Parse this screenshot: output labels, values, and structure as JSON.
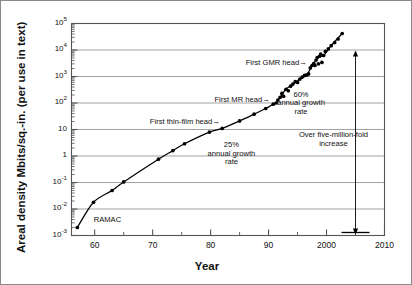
{
  "figure": {
    "name": "areal-density-vs-year",
    "axis_titles": {
      "x": "Year",
      "y": "Areal density Mbits/sq.-in. (per use in text)"
    }
  },
  "chart_data": {
    "type": "scatter",
    "title": "",
    "xlabel": "Year",
    "ylabel": "Areal density Mbits/sq.-in. (per use in text)",
    "xlim": [
      1956,
      2010
    ],
    "ylim": [
      0.001,
      100000
    ],
    "yscale": "log",
    "grid": "horizontal-major-only",
    "legend": "none",
    "x_major_ticks": [
      1960,
      1970,
      1980,
      1990,
      2000,
      2010
    ],
    "x_major_tick_labels": [
      "60",
      "70",
      "80",
      "90",
      "2000",
      "2010"
    ],
    "x_minor_ticks": [
      1965,
      1975,
      1985,
      1995,
      2005
    ],
    "y_major_ticks": [
      0.001,
      0.01,
      0.1,
      1,
      10,
      100,
      1000,
      10000,
      100000
    ],
    "y_major_tick_labels": [
      "10-3",
      "10-2",
      "10-1",
      "1",
      "10",
      "102",
      "103",
      "104",
      "105"
    ],
    "y_tick_mantissas": [
      "10",
      "10",
      "10",
      "1",
      "10",
      "10",
      "10",
      "10",
      "10"
    ],
    "y_tick_exponents": [
      "-3",
      "-2",
      "-1",
      "",
      "",
      "2",
      "3",
      "4",
      "5"
    ],
    "series": [
      {
        "name": "Areal density",
        "marker": "filled-circle",
        "line": "solid-trend",
        "points": [
          [
            1957.0,
            0.002
          ],
          [
            1959.8,
            0.018
          ],
          [
            1963.0,
            0.05
          ],
          [
            1965.0,
            0.105
          ],
          [
            1971.0,
            0.76
          ],
          [
            1973.5,
            1.6
          ],
          [
            1975.5,
            2.9
          ],
          [
            1979.8,
            8.0
          ],
          [
            1982.0,
            11.0
          ],
          [
            1985.0,
            21.0
          ],
          [
            1987.5,
            38.0
          ],
          [
            1989.5,
            62.0
          ],
          [
            1990.8,
            90.0
          ],
          [
            1991.3,
            100.0
          ],
          [
            1991.6,
            130.0
          ],
          [
            1992.0,
            165.0
          ],
          [
            1992.3,
            230.0
          ],
          [
            1992.6,
            180.0
          ],
          [
            1993.0,
            330.0
          ],
          [
            1993.4,
            290.0
          ],
          [
            1993.8,
            430.0
          ],
          [
            1994.2,
            520.0
          ],
          [
            1994.6,
            640.0
          ],
          [
            1995.0,
            600.0
          ],
          [
            1995.4,
            800.0
          ],
          [
            1995.8,
            950.0
          ],
          [
            1996.2,
            1100.0
          ],
          [
            1996.6,
            1150.0
          ],
          [
            1996.9,
            1250.0
          ],
          [
            1997.2,
            2100.0
          ],
          [
            1997.5,
            2600.0
          ],
          [
            1997.8,
            3100.0
          ],
          [
            1998.0,
            2600.0
          ],
          [
            1998.2,
            4200.0
          ],
          [
            1998.4,
            5200.0
          ],
          [
            1998.6,
            3000.0
          ],
          [
            1998.8,
            5800.0
          ],
          [
            1999.0,
            7000.0
          ],
          [
            1999.2,
            3400.0
          ],
          [
            1999.5,
            6200.0
          ],
          [
            1999.8,
            8800.0
          ],
          [
            2000.3,
            11000.0
          ],
          [
            2000.8,
            14500.0
          ],
          [
            2001.4,
            19000.0
          ],
          [
            2002.0,
            26000.0
          ],
          [
            2002.7,
            42000.0
          ]
        ]
      }
    ],
    "annotations": [
      {
        "id": "ramac",
        "text": "RAMAC",
        "x": 1959.4,
        "y": 0.0035
      },
      {
        "id": "first-thin-film-head",
        "text": "First thin-film head",
        "x": 1979.0,
        "y": 17.0,
        "arrow": "right"
      },
      {
        "id": "first-mr-head",
        "text": "First MR head",
        "x": 1988.0,
        "y": 110.0,
        "arrow": "right"
      },
      {
        "id": "first-gmr-head",
        "text": "First GMR head",
        "x": 1994.5,
        "y": 2800.0,
        "arrow": "right"
      },
      {
        "id": "growth-25",
        "text": "25%\nannual growth\nrate",
        "x": 1983.5,
        "y": 2.0
      },
      {
        "id": "growth-60",
        "text": "60%\nannual growth\nrate",
        "x": 1995.5,
        "y": 180.0
      },
      {
        "id": "five-million-fold",
        "text": "Over five-million-fold\nincrease",
        "x": 2001.0,
        "y": 4.5,
        "arrow": "double-vertical"
      }
    ]
  },
  "annotations_text": {
    "ramac": "RAMAC",
    "thin_film": "First thin-film head",
    "mr_head": "First MR head",
    "gmr_head": "First GMR head",
    "growth25_l1": "25%",
    "growth25_l2": "annual growth",
    "growth25_l3": "rate",
    "growth60_l1": "60%",
    "growth60_l2": "annual growth",
    "growth60_l3": "rate",
    "fivefold_l1": "Over five-million-fold",
    "fivefold_l2": "increase",
    "arrow_glyph": "→"
  },
  "ticks": {
    "y": [
      {
        "m": "10",
        "e": "5"
      },
      {
        "m": "10",
        "e": "4"
      },
      {
        "m": "10",
        "e": "3"
      },
      {
        "m": "10",
        "e": "2"
      },
      {
        "m": "10",
        "e": ""
      },
      {
        "m": "1",
        "e": ""
      },
      {
        "m": "10",
        "e": "-1"
      },
      {
        "m": "10",
        "e": "-2"
      },
      {
        "m": "10",
        "e": "-3"
      }
    ],
    "x": [
      "60",
      "70",
      "80",
      "90",
      "2000",
      "2010"
    ]
  },
  "colors": {
    "frame": "#555555",
    "grid": "#999999",
    "data": "#000000",
    "text": "#111111",
    "border": "#8a8a8a"
  }
}
